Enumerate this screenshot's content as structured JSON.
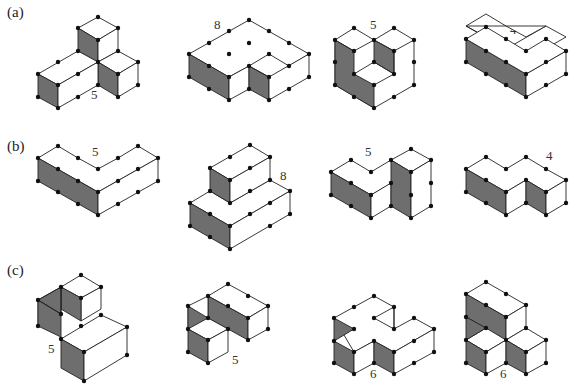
{
  "rows": [
    {
      "label": "(a)",
      "figures": [
        {
          "id": "a1",
          "count": "5"
        },
        {
          "id": "a2",
          "count": "8"
        },
        {
          "id": "a3",
          "count": "5"
        },
        {
          "id": "a4",
          "count": "4"
        }
      ]
    },
    {
      "label": "(b)",
      "figures": [
        {
          "id": "b1",
          "count": "5"
        },
        {
          "id": "b2",
          "count": "8"
        },
        {
          "id": "b3",
          "count": "5"
        },
        {
          "id": "b4",
          "count": "4"
        }
      ]
    },
    {
      "label": "(c)",
      "figures": [
        {
          "id": "c1",
          "count": "5"
        },
        {
          "id": "c2",
          "count": "5"
        },
        {
          "id": "c3",
          "count": "6"
        },
        {
          "id": "c4",
          "count": "6"
        }
      ]
    }
  ],
  "colors": {
    "shade": "#6e6e6e",
    "edge": "#222222",
    "dot": "#111111"
  }
}
